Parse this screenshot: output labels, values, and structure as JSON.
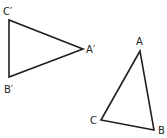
{
  "diagram": {
    "triangles": [
      {
        "name": "A'B'C'",
        "vertices": [
          {
            "label": "C′",
            "x": 9,
            "y": 20,
            "lx": 3,
            "ly": 15
          },
          {
            "label": "B′",
            "x": 9,
            "y": 77,
            "lx": 4,
            "ly": 93
          },
          {
            "label": "A′",
            "x": 83,
            "y": 49,
            "lx": 86,
            "ly": 53
          }
        ]
      },
      {
        "name": "ABC",
        "vertices": [
          {
            "label": "A",
            "x": 140,
            "y": 51,
            "lx": 136,
            "ly": 45
          },
          {
            "label": "C",
            "x": 101,
            "y": 120,
            "lx": 90,
            "ly": 124
          },
          {
            "label": "B",
            "x": 154,
            "y": 130,
            "lx": 158,
            "ly": 134
          }
        ]
      }
    ],
    "stroke_color": "#231f20"
  }
}
